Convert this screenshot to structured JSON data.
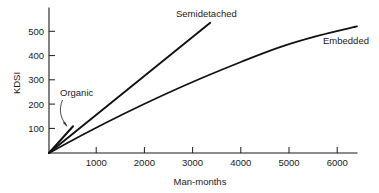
{
  "chart_data": {
    "type": "line",
    "title": "",
    "subtitle": "",
    "xlabel": "Man-months",
    "ylabel": "KDSI",
    "xlim": [
      0,
      6400
    ],
    "ylim": [
      0,
      600
    ],
    "xticks": [
      1000,
      2000,
      3000,
      4000,
      5000,
      6000
    ],
    "xtick_labels": [
      "1000",
      "2000",
      "3000",
      "4000",
      "5000",
      "6000"
    ],
    "yticks": [
      100,
      200,
      300,
      400,
      500
    ],
    "ytick_labels": [
      "100",
      "200",
      "300",
      "400",
      "500"
    ],
    "grid": false,
    "legend": "inline-annotations",
    "annotations": [
      {
        "text": "Organic",
        "target_series": "Organic",
        "style": "curved-arrow"
      },
      {
        "text": "Semidetached",
        "target_series": "Semidetached",
        "style": "adjacent"
      },
      {
        "text": "Embedded",
        "target_series": "Embedded",
        "style": "adjacent"
      }
    ],
    "series": [
      {
        "name": "Organic",
        "label": "Organic",
        "shape": "straight",
        "x": [
          0,
          500
        ],
        "y": [
          0,
          110
        ]
      },
      {
        "name": "Semidetached",
        "label": "Semidetached",
        "shape": "straight",
        "x": [
          0,
          3350
        ],
        "y": [
          0,
          535
        ]
      },
      {
        "name": "Embedded",
        "label": "Embedded",
        "shape": "concave-curve",
        "x": [
          0,
          800,
          1600,
          2400,
          3200,
          4000,
          4800,
          5600,
          6400
        ],
        "y": [
          0,
          85,
          165,
          240,
          310,
          375,
          435,
          482,
          520
        ]
      }
    ]
  },
  "axes": {
    "y_axis_title": "KDSI",
    "x_axis_title": "Man-months"
  },
  "labels": {
    "organic": "Organic",
    "semidetached": "Semidetached",
    "embedded": "Embedded"
  }
}
